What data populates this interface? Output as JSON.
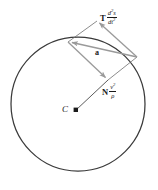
{
  "figure": {
    "background_color": "#ffffff",
    "circle": {
      "stroke_color": "#3a3a3a",
      "center_x": 78,
      "center_y": 104,
      "radius": 67
    },
    "center_point": {
      "label": "C",
      "dot_color": "#1a1a1a",
      "dot_x": 76,
      "dot_y": 110
    },
    "vectors": {
      "resultant": {
        "name": "a",
        "label": "a",
        "color": "#9a9a9a",
        "from_x": 136,
        "from_y": 57,
        "to_x": 68,
        "to_y": 42
      },
      "tangential": {
        "name": "tangential-component",
        "symbol": "T",
        "numerator": "d",
        "numerator_exponent": "2",
        "numerator_var": "s",
        "denominator": "dt",
        "denominator_exponent": "2",
        "color": "#9a9a9a",
        "from_x": 136,
        "from_y": 57,
        "to_x": 97,
        "to_y": 21
      },
      "normal": {
        "name": "normal-component",
        "symbol": "N",
        "numerator": "v",
        "numerator_exponent": "2",
        "denominator": "ρ",
        "color": "#9a9a9a",
        "from_x": 68,
        "from_y": 42,
        "to_x": 108,
        "to_y": 80
      }
    },
    "radius_line": {
      "name": "radius-line",
      "color": "#4a4a4a",
      "from_x": 76,
      "from_y": 110,
      "to_x": 108,
      "to_y": 80
    },
    "parallelogram_edges": {
      "color": "#6f6f6f",
      "edge_top_from_x": 97,
      "edge_top_from_y": 21,
      "edge_top_to_x": 68,
      "edge_top_to_y": 42,
      "edge_bottom_from_x": 108,
      "edge_bottom_from_y": 80,
      "edge_bottom_to_x": 136,
      "edge_bottom_to_y": 57
    }
  }
}
